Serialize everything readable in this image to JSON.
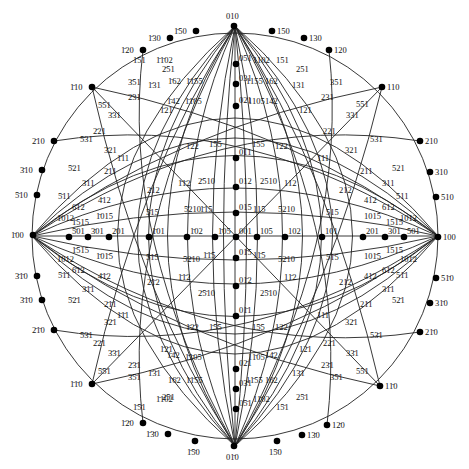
{
  "diagram": {
    "center": [
      234,
      234
    ],
    "radius": 208,
    "colors": {
      "line": "#222222",
      "pole": "#000000",
      "text": "#111111",
      "background": "#ffffff"
    }
  },
  "primitive_poles": [
    {
      "label": "010",
      "x": 234,
      "y": 26
    },
    {
      "label": "1̄50",
      "x": 196,
      "y": 31
    },
    {
      "label": "1̄30",
      "x": 170,
      "y": 38
    },
    {
      "label": "1̄20",
      "x": 143,
      "y": 50
    },
    {
      "label": "150",
      "x": 272,
      "y": 31
    },
    {
      "label": "130",
      "x": 304,
      "y": 38
    },
    {
      "label": "120",
      "x": 329,
      "y": 50
    },
    {
      "label": "1̄10",
      "x": 92,
      "y": 87
    },
    {
      "label": "110",
      "x": 382,
      "y": 87
    },
    {
      "label": "2̄10",
      "x": 54,
      "y": 141
    },
    {
      "label": "210",
      "x": 420,
      "y": 141
    },
    {
      "label": "3̄10",
      "x": 42,
      "y": 170
    },
    {
      "label": "310",
      "x": 430,
      "y": 172
    },
    {
      "label": "5̄10",
      "x": 37,
      "y": 195
    },
    {
      "label": "510",
      "x": 436,
      "y": 197
    },
    {
      "label": "1̄00",
      "x": 33,
      "y": 235
    },
    {
      "label": "100",
      "x": 438,
      "y": 237
    },
    {
      "label": "3̄1̄0",
      "x": 37,
      "y": 276
    },
    {
      "label": "51̄0",
      "x": 436,
      "y": 278
    },
    {
      "label": "3̄1̄0",
      "x": 42,
      "y": 300
    },
    {
      "label": "31̄0",
      "x": 430,
      "y": 303
    },
    {
      "label": "2̄1̄0",
      "x": 54,
      "y": 330
    },
    {
      "label": "21̄0",
      "x": 420,
      "y": 332
    },
    {
      "label": "1̄1̄0",
      "x": 92,
      "y": 384
    },
    {
      "label": "11̄0",
      "x": 380,
      "y": 386
    },
    {
      "label": "1̄2̄0",
      "x": 143,
      "y": 423
    },
    {
      "label": "12̄0",
      "x": 327,
      "y": 425
    },
    {
      "label": "1̄3̄0",
      "x": 168,
      "y": 434
    },
    {
      "label": "13̄0",
      "x": 302,
      "y": 435
    },
    {
      "label": "1̄5̄0",
      "x": 195,
      "y": 441
    },
    {
      "label": "15̄0",
      "x": 277,
      "y": 441
    },
    {
      "label": "01̄0",
      "x": 234,
      "y": 446
    }
  ],
  "axis_poles": [
    {
      "label": "001",
      "x": 236,
      "y": 237
    },
    {
      "label": "051",
      "x": 236,
      "y": 64
    },
    {
      "label": "031",
      "x": 236,
      "y": 84
    },
    {
      "label": "021",
      "x": 236,
      "y": 106
    },
    {
      "label": "011",
      "x": 236,
      "y": 158
    },
    {
      "label": "012",
      "x": 236,
      "y": 187
    },
    {
      "label": "015",
      "x": 236,
      "y": 213
    },
    {
      "label": "01̄5",
      "x": 236,
      "y": 258
    },
    {
      "label": "01̄2",
      "x": 236,
      "y": 286
    },
    {
      "label": "01̄1",
      "x": 236,
      "y": 316
    },
    {
      "label": "02̄1",
      "x": 236,
      "y": 369
    },
    {
      "label": "03̄1",
      "x": 236,
      "y": 389
    },
    {
      "label": "05̄1",
      "x": 236,
      "y": 409
    },
    {
      "label": "1̄05",
      "x": 215,
      "y": 237
    },
    {
      "label": "1̄02",
      "x": 187,
      "y": 237
    },
    {
      "label": "1̄01",
      "x": 149,
      "y": 237
    },
    {
      "label": "2̄01",
      "x": 109,
      "y": 237
    },
    {
      "label": "3̄01",
      "x": 88,
      "y": 237
    },
    {
      "label": "5̄01",
      "x": 69,
      "y": 237
    },
    {
      "label": "105",
      "x": 257,
      "y": 237
    },
    {
      "label": "102",
      "x": 285,
      "y": 237
    },
    {
      "label": "101",
      "x": 322,
      "y": 237
    },
    {
      "label": "201",
      "x": 363,
      "y": 237
    },
    {
      "label": "301",
      "x": 385,
      "y": 237
    },
    {
      "label": "501",
      "x": 404,
      "y": 237
    }
  ],
  "labels": [
    {
      "t": "1̄51",
      "x": 133,
      "y": 63
    },
    {
      "t": "1̄1̄02",
      "x": 156,
      "y": 63
    },
    {
      "t": "1102",
      "x": 253,
      "y": 63
    },
    {
      "t": "151",
      "x": 276,
      "y": 63
    },
    {
      "t": "2̄51",
      "x": 162,
      "y": 72
    },
    {
      "t": "251",
      "x": 296,
      "y": 72
    },
    {
      "t": "3̄51",
      "x": 128,
      "y": 85
    },
    {
      "t": "351",
      "x": 330,
      "y": 85
    },
    {
      "t": "1̄31",
      "x": 148,
      "y": 88
    },
    {
      "t": "1̄62",
      "x": 168,
      "y": 84
    },
    {
      "t": "1̄1̄55",
      "x": 186,
      "y": 84
    },
    {
      "t": "1155",
      "x": 246,
      "y": 84
    },
    {
      "t": "162",
      "x": 265,
      "y": 84
    },
    {
      "t": "131",
      "x": 292,
      "y": 88
    },
    {
      "t": "5̄51",
      "x": 98,
      "y": 108
    },
    {
      "t": "551",
      "x": 356,
      "y": 107
    },
    {
      "t": "2̄31",
      "x": 128,
      "y": 100
    },
    {
      "t": "231",
      "x": 321,
      "y": 100
    },
    {
      "t": "3̄31",
      "x": 108,
      "y": 118
    },
    {
      "t": "331",
      "x": 346,
      "y": 118
    },
    {
      "t": "1̄42",
      "x": 167,
      "y": 104
    },
    {
      "t": "1̄1̄05",
      "x": 185,
      "y": 104
    },
    {
      "t": "1105",
      "x": 248,
      "y": 104
    },
    {
      "t": "142",
      "x": 265,
      "y": 104
    },
    {
      "t": "1̄21",
      "x": 160,
      "y": 113
    },
    {
      "t": "121",
      "x": 299,
      "y": 113
    },
    {
      "t": "2̄21",
      "x": 93,
      "y": 134
    },
    {
      "t": "221",
      "x": 323,
      "y": 134
    },
    {
      "t": "5̄31",
      "x": 80,
      "y": 142
    },
    {
      "t": "531",
      "x": 370,
      "y": 142
    },
    {
      "t": "3̄21",
      "x": 104,
      "y": 153
    },
    {
      "t": "321",
      "x": 345,
      "y": 153
    },
    {
      "t": "1̄11",
      "x": 117,
      "y": 161
    },
    {
      "t": "111",
      "x": 317,
      "y": 161
    },
    {
      "t": "1̄22",
      "x": 186,
      "y": 149
    },
    {
      "t": "1̄55",
      "x": 209,
      "y": 147
    },
    {
      "t": "155",
      "x": 252,
      "y": 147
    },
    {
      "t": "122",
      "x": 275,
      "y": 149
    },
    {
      "t": "5̄21",
      "x": 68,
      "y": 171
    },
    {
      "t": "521",
      "x": 392,
      "y": 171
    },
    {
      "t": "2̄11",
      "x": 104,
      "y": 174
    },
    {
      "t": "211",
      "x": 360,
      "y": 174
    },
    {
      "t": "3̄11",
      "x": 82,
      "y": 186
    },
    {
      "t": "311",
      "x": 382,
      "y": 186
    },
    {
      "t": "2̄12",
      "x": 147,
      "y": 193
    },
    {
      "t": "212",
      "x": 339,
      "y": 193
    },
    {
      "t": "1̄1̄2",
      "x": 178,
      "y": 186
    },
    {
      "t": "2̄510",
      "x": 198,
      "y": 184
    },
    {
      "t": "2510",
      "x": 260,
      "y": 184
    },
    {
      "t": "112",
      "x": 284,
      "y": 186
    },
    {
      "t": "5̄11",
      "x": 58,
      "y": 199
    },
    {
      "t": "511",
      "x": 396,
      "y": 199
    },
    {
      "t": "4̄12",
      "x": 98,
      "y": 203
    },
    {
      "t": "412",
      "x": 364,
      "y": 203
    },
    {
      "t": "6̄12",
      "x": 72,
      "y": 210
    },
    {
      "t": "612",
      "x": 382,
      "y": 210
    },
    {
      "t": "1̄012",
      "x": 57,
      "y": 221
    },
    {
      "t": "1012",
      "x": 400,
      "y": 221
    },
    {
      "t": "1̄015",
      "x": 96,
      "y": 219
    },
    {
      "t": "1015",
      "x": 364,
      "y": 219
    },
    {
      "t": "5̄15",
      "x": 146,
      "y": 215
    },
    {
      "t": "515",
      "x": 326,
      "y": 215
    },
    {
      "t": "5̄210",
      "x": 184,
      "y": 212
    },
    {
      "t": "1̄15",
      "x": 200,
      "y": 212
    },
    {
      "t": "115",
      "x": 253,
      "y": 212
    },
    {
      "t": "5210",
      "x": 278,
      "y": 212
    },
    {
      "t": "1̄515",
      "x": 72,
      "y": 225
    },
    {
      "t": "1515",
      "x": 386,
      "y": 225
    },
    {
      "t": "1̄515",
      "x": 72,
      "y": 253
    },
    {
      "t": "1515",
      "x": 386,
      "y": 253
    },
    {
      "t": "1̄012",
      "x": 57,
      "y": 262
    },
    {
      "t": "101̄2",
      "x": 400,
      "y": 262
    },
    {
      "t": "1̄01̄5",
      "x": 96,
      "y": 259
    },
    {
      "t": "101̄5",
      "x": 364,
      "y": 259
    },
    {
      "t": "5̄1̄5",
      "x": 146,
      "y": 260
    },
    {
      "t": "51̄5",
      "x": 326,
      "y": 260
    },
    {
      "t": "5̄2̄10",
      "x": 183,
      "y": 262
    },
    {
      "t": "1̄1̄5",
      "x": 203,
      "y": 258
    },
    {
      "t": "11̄5",
      "x": 253,
      "y": 258
    },
    {
      "t": "52̄10",
      "x": 278,
      "y": 262
    },
    {
      "t": "6̄1̄2",
      "x": 72,
      "y": 273
    },
    {
      "t": "61̄2",
      "x": 382,
      "y": 273
    },
    {
      "t": "5̄1̄1",
      "x": 58,
      "y": 278
    },
    {
      "t": "51̄1",
      "x": 396,
      "y": 278
    },
    {
      "t": "4̄1̄2",
      "x": 98,
      "y": 279
    },
    {
      "t": "41̄2",
      "x": 364,
      "y": 279
    },
    {
      "t": "2̄1̄2",
      "x": 147,
      "y": 285
    },
    {
      "t": "21̄2",
      "x": 339,
      "y": 285
    },
    {
      "t": "1̄1̄2",
      "x": 178,
      "y": 280
    },
    {
      "t": "2̄5̄10",
      "x": 198,
      "y": 296
    },
    {
      "t": "25̄10",
      "x": 260,
      "y": 296
    },
    {
      "t": "11̄2",
      "x": 284,
      "y": 280
    },
    {
      "t": "3̄1̄1",
      "x": 82,
      "y": 292
    },
    {
      "t": "31̄1",
      "x": 382,
      "y": 292
    },
    {
      "t": "5̄2̄1",
      "x": 68,
      "y": 303
    },
    {
      "t": "52̄1",
      "x": 392,
      "y": 303
    },
    {
      "t": "2̄1̄1",
      "x": 104,
      "y": 307
    },
    {
      "t": "21̄1",
      "x": 360,
      "y": 307
    },
    {
      "t": "1̄1̄1",
      "x": 117,
      "y": 318
    },
    {
      "t": "11̄1",
      "x": 317,
      "y": 318
    },
    {
      "t": "1̄2̄2",
      "x": 186,
      "y": 330
    },
    {
      "t": "1̄5̄5",
      "x": 209,
      "y": 330
    },
    {
      "t": "15̄5",
      "x": 252,
      "y": 330
    },
    {
      "t": "12̄2",
      "x": 275,
      "y": 330
    },
    {
      "t": "3̄2̄1",
      "x": 104,
      "y": 325
    },
    {
      "t": "32̄1",
      "x": 345,
      "y": 325
    },
    {
      "t": "5̄3̄1",
      "x": 80,
      "y": 338
    },
    {
      "t": "53̄1",
      "x": 370,
      "y": 338
    },
    {
      "t": "2̄2̄1",
      "x": 93,
      "y": 346
    },
    {
      "t": "22̄1",
      "x": 323,
      "y": 346
    },
    {
      "t": "1̄2̄1",
      "x": 160,
      "y": 352
    },
    {
      "t": "12̄1",
      "x": 299,
      "y": 352
    },
    {
      "t": "1̄4̄2",
      "x": 167,
      "y": 358
    },
    {
      "t": "1̄1̄05",
      "x": 185,
      "y": 360
    },
    {
      "t": "11̄05",
      "x": 248,
      "y": 360
    },
    {
      "t": "14̄2",
      "x": 265,
      "y": 358
    },
    {
      "t": "3̄3̄1",
      "x": 108,
      "y": 356
    },
    {
      "t": "33̄1",
      "x": 346,
      "y": 356
    },
    {
      "t": "2̄3̄1",
      "x": 128,
      "y": 368
    },
    {
      "t": "23̄1",
      "x": 321,
      "y": 368
    },
    {
      "t": "5̄5̄1",
      "x": 98,
      "y": 374
    },
    {
      "t": "55̄1",
      "x": 356,
      "y": 374
    },
    {
      "t": "1̄3̄1",
      "x": 148,
      "y": 376
    },
    {
      "t": "1̄6̄2",
      "x": 168,
      "y": 383
    },
    {
      "t": "1̄1̄55",
      "x": 186,
      "y": 383
    },
    {
      "t": "11̄55",
      "x": 246,
      "y": 383
    },
    {
      "t": "16̄2",
      "x": 265,
      "y": 383
    },
    {
      "t": "13̄1",
      "x": 292,
      "y": 376
    },
    {
      "t": "3̄5̄1",
      "x": 128,
      "y": 380
    },
    {
      "t": "35̄1",
      "x": 330,
      "y": 380
    },
    {
      "t": "2̄5̄1",
      "x": 162,
      "y": 400
    },
    {
      "t": "25̄1",
      "x": 296,
      "y": 400
    },
    {
      "t": "1̄5̄1",
      "x": 133,
      "y": 410
    },
    {
      "t": "1̄1̄02",
      "x": 156,
      "y": 402
    },
    {
      "t": "11̄02",
      "x": 253,
      "y": 402
    },
    {
      "t": "15̄1",
      "x": 276,
      "y": 410
    }
  ]
}
